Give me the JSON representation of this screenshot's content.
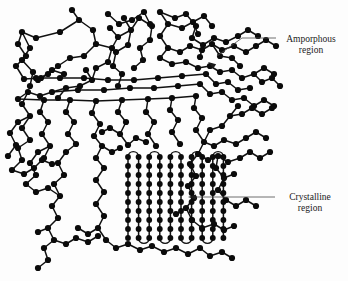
{
  "figure": {
    "background_color": "#fdfdfd",
    "node_color": "#0b0b0b",
    "bond_color": "#111111",
    "leader_color": "#4a4a4a",
    "width": 348,
    "height": 281
  },
  "labels": [
    {
      "id": "amorphous",
      "line1": "Amporphous",
      "line2": "region",
      "text_x": 311,
      "text_y": 42,
      "leader_points": "242,38 216,55",
      "leader_h_x1": 276,
      "leader_h_x2": 242,
      "leader_h_y": 38,
      "arrow_tip_x": 208,
      "arrow_tip_y": 62,
      "arrow_angle": 213
    },
    {
      "id": "crystalline",
      "line1": "Crystalline",
      "line2": "region",
      "text_x": 310,
      "text_y": 200,
      "leader_h_x1": 275,
      "leader_h_x2": 196,
      "leader_h_y": 197,
      "arrow_tip_x": 188,
      "arrow_tip_y": 197,
      "arrow_angle": 180
    }
  ],
  "crystalline": {
    "column_count": 10,
    "x_start": 128,
    "x_step": 10.6,
    "y_top": 157,
    "y_bottom": 238,
    "row_spacing": 9.0,
    "node_radius": 2.9,
    "fold_radius": 5.3
  },
  "amorphous": {
    "node_radius": 3.1,
    "description": "tangled random-coil chain network surrounding the lamellar crystallite"
  },
  "chart_data": {
    "type": "diagram",
    "annotations": [
      "Amporphous region",
      "Crystalline region"
    ]
  }
}
